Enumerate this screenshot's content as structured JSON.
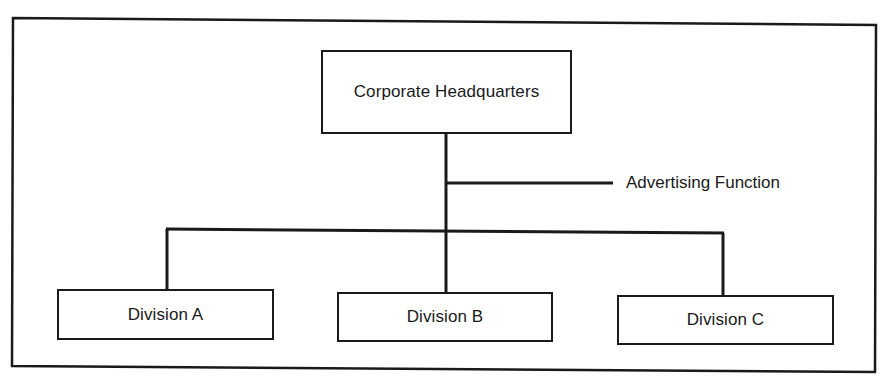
{
  "diagram": {
    "type": "organization-chart",
    "root": {
      "label": "Corporate Headquarters"
    },
    "staff_function": {
      "label": "Advertising Function"
    },
    "divisions": [
      {
        "label": "Division A"
      },
      {
        "label": "Division B"
      },
      {
        "label": "Division C"
      }
    ],
    "colors": {
      "line": "#1a1a1a",
      "background": "#ffffff"
    }
  }
}
